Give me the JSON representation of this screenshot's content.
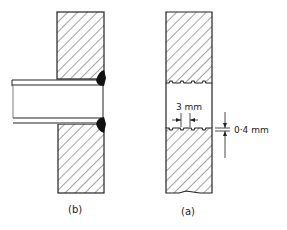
{
  "figure": {
    "panels": [
      {
        "id": "b",
        "caption": "(b)",
        "description": "tube welded into plate"
      },
      {
        "id": "a",
        "caption": "(a)",
        "description": "grooved hole in plate"
      }
    ],
    "dimensions": {
      "groove_pitch": "3 mm",
      "groove_depth": "0·4 mm"
    },
    "colors": {
      "ink": "#222222",
      "background": "#ffffff"
    }
  }
}
